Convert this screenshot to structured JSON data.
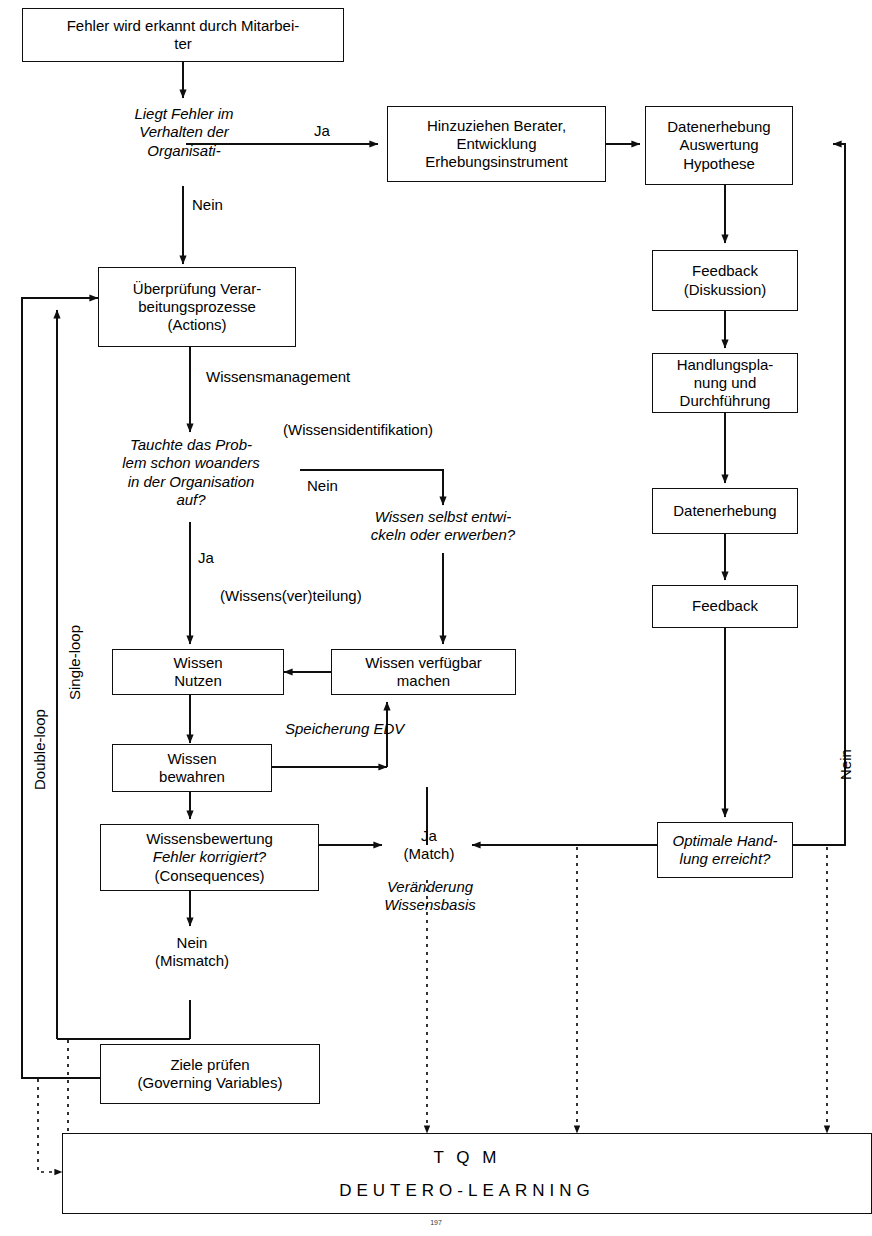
{
  "diagram": {
    "boxes": {
      "fehler_erkannt": "Fehler wird erkannt durch Mitarbei-\nter",
      "hinzuziehen": "Hinzuziehen Berater,\nEntwicklung\nErhebungsinstrument",
      "datenerhebung_auswertung": "Datenerhebung\nAuswertung\nHypothese",
      "feedback_diskussion": "Feedback\n(Diskussion)",
      "handlungsplanung": "Handlungspla-\nnung und\nDurchführung",
      "datenerhebung": "Datenerhebung",
      "feedback": "Feedback",
      "optimale_handlung": "Optimale Hand-\nlung erreicht?",
      "ueberpruefung": "Überprüfung Verar-\nbeitungsprozesse\n(Actions)",
      "wissen_nutzen": "Wissen\nNutzen",
      "wissen_verfuegbar": "Wissen verfügbar\nmachen",
      "wissen_bewahren": "Wissen\nbewahren",
      "wissensbewertung_l1": "Wissensbewertung",
      "wissensbewertung_l2": "Fehler korrigiert?",
      "wissensbewertung_l3": "(Consequences)",
      "ziele_pruefen": "Ziele prüfen\n(Governing Variables)",
      "tqm": "T Q M",
      "deutero": "DEUTERO-LEARNING"
    },
    "decisions": {
      "liegt_fehler": "Liegt Fehler im\nVerhalten der\nOrganisati-",
      "tauchte_problem": "Tauchte das Prob-\nlem schon woanders\nin der Organisation\nauf?",
      "wissen_selbst": "Wissen selbst entwi-\nckeln oder erwerben?"
    },
    "edge_labels": {
      "ja_top": "Ja",
      "nein_top": "Nein",
      "wissensmanagement": "Wissensmanagement",
      "wissensidentifikation": "(Wissensidentifikation)",
      "nein_identifikation": "Nein",
      "ja_tauchte": "Ja",
      "wissensverteilung": "(Wissens(ver)teilung)",
      "speicherung_edv": "Speicherung EDV",
      "ja_match": "Ja\n(Match)",
      "veraenderung_wissensbasis": "Veränderung\nWissensbasis",
      "nein_mismatch": "Nein\n(Mismatch)",
      "nein_right": "Nein"
    },
    "loop_labels": {
      "single_loop": "Single-loop",
      "double_loop": "Double-loop"
    },
    "page_number": "197",
    "colors": {
      "line": "#0f0f0f",
      "text": "#000000",
      "background": "#ffffff"
    }
  }
}
